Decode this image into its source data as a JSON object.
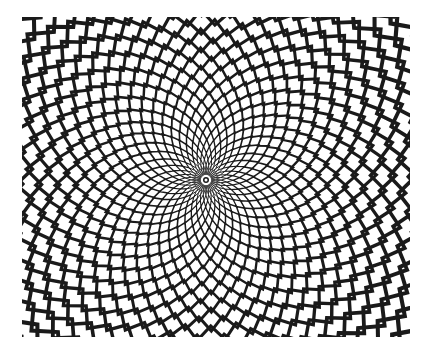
{
  "image": {
    "subject": "zigzag concentric-ring optical illusion",
    "colors": {
      "background": "#ffffff",
      "stroke": "#1a1a1a"
    },
    "pattern": {
      "ring_count": 34,
      "teeth_per_ring": 36,
      "twist_per_ring": 0.09
    }
  }
}
